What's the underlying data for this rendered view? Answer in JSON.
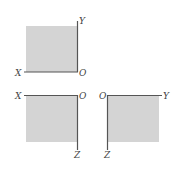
{
  "colors": {
    "fill": "#d4d4d4",
    "axis": "#555555",
    "label": "#444444"
  },
  "views": [
    {
      "name": "top-view",
      "labels": {
        "horizontal": "X",
        "origin": "O",
        "vertical": "Y"
      }
    },
    {
      "name": "front-view",
      "labels": {
        "horizontal": "X",
        "origin": "O",
        "vertical": "Z"
      }
    },
    {
      "name": "side-view",
      "labels": {
        "origin": "O",
        "horizontal": "Y",
        "vertical": "Z"
      }
    }
  ]
}
